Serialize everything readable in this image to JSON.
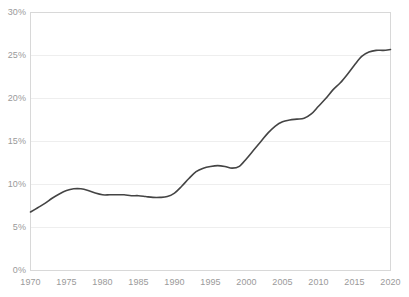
{
  "chart_data": {
    "type": "line",
    "title": "",
    "subtitle": "",
    "xlabel": "",
    "ylabel": "",
    "xlim": [
      1970,
      2020
    ],
    "ylim": [
      0,
      30
    ],
    "grid": true,
    "legend": null,
    "y_tick_labels": [
      "30%",
      "25%",
      "20%",
      "15%",
      "10%",
      "5%",
      "0%"
    ],
    "y_ticks": [
      30,
      25,
      20,
      15,
      10,
      5,
      0
    ],
    "x_tick_labels": [
      "1970",
      "1975",
      "1980",
      "1985",
      "1990",
      "1995",
      "2000",
      "2005",
      "2010",
      "2015",
      "2020"
    ],
    "x_ticks": [
      1970,
      1975,
      1980,
      1985,
      1990,
      1995,
      2000,
      2005,
      2010,
      2015,
      2020
    ],
    "series": [
      {
        "name": "share",
        "color": "#444444",
        "x": [
          1970,
          1971,
          1972,
          1973,
          1974,
          1975,
          1976,
          1977,
          1978,
          1979,
          1980,
          1981,
          1982,
          1983,
          1984,
          1985,
          1986,
          1987,
          1988,
          1989,
          1990,
          1991,
          1992,
          1993,
          1994,
          1995,
          1996,
          1997,
          1998,
          1999,
          2000,
          2001,
          2002,
          2003,
          2004,
          2005,
          2006,
          2007,
          2008,
          2009,
          2010,
          2011,
          2012,
          2013,
          2014,
          2015,
          2016,
          2017,
          2018,
          2019,
          2020
        ],
        "values": [
          6.8,
          7.3,
          7.8,
          8.4,
          8.9,
          9.3,
          9.5,
          9.5,
          9.3,
          9.0,
          8.8,
          8.8,
          8.8,
          8.8,
          8.7,
          8.7,
          8.6,
          8.5,
          8.5,
          8.6,
          9.0,
          9.8,
          10.7,
          11.5,
          11.9,
          12.1,
          12.2,
          12.1,
          11.9,
          12.1,
          13.0,
          14.0,
          15.0,
          16.0,
          16.8,
          17.3,
          17.5,
          17.6,
          17.7,
          18.2,
          19.1,
          20.0,
          21.0,
          21.8,
          22.8,
          23.9,
          24.9,
          25.4,
          25.6,
          25.6,
          25.7
        ]
      }
    ]
  },
  "axis": {
    "y_title": "",
    "x_title": ""
  },
  "colors": {
    "line": "#444444",
    "grid": "#eeeeee",
    "axis_border": "#d8d8d8",
    "tick_text": "#9a9a9a",
    "background": "#ffffff"
  }
}
